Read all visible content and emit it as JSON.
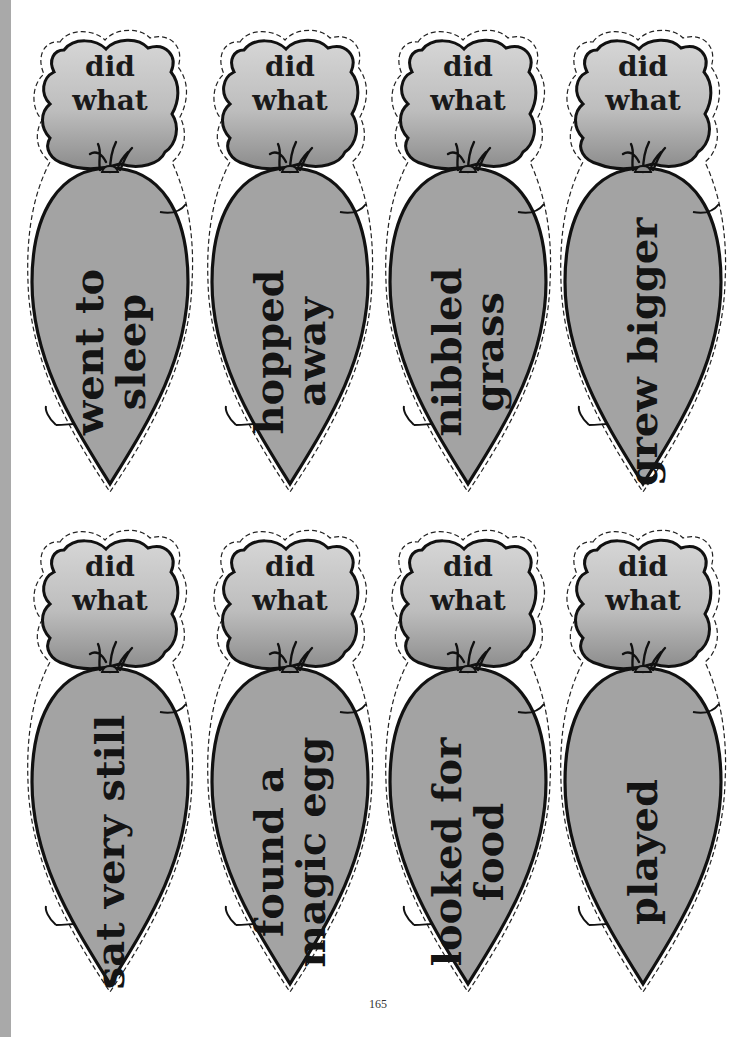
{
  "page": {
    "page_number": "165",
    "colors": {
      "carrot_fill": "#a3a3a3",
      "leaf_top": "#d4d4d4",
      "leaf_bottom": "#8a8a8a",
      "outline": "#111111",
      "edge_strip": "#a9a9a9"
    }
  },
  "cards": [
    {
      "leaf_line1": "did",
      "leaf_line2": "what",
      "body_line1": "went to",
      "body_line2": "sleep"
    },
    {
      "leaf_line1": "did",
      "leaf_line2": "what",
      "body_line1": "hopped",
      "body_line2": "away"
    },
    {
      "leaf_line1": "did",
      "leaf_line2": "what",
      "body_line1": "nibbled",
      "body_line2": "grass"
    },
    {
      "leaf_line1": "did",
      "leaf_line2": "what",
      "body_line1": "grew bigger",
      "body_line2": ""
    },
    {
      "leaf_line1": "did",
      "leaf_line2": "what",
      "body_line1": "sat very still",
      "body_line2": ""
    },
    {
      "leaf_line1": "did",
      "leaf_line2": "what",
      "body_line1": "found a",
      "body_line2": "magic egg"
    },
    {
      "leaf_line1": "did",
      "leaf_line2": "what",
      "body_line1": "looked for",
      "body_line2": "food"
    },
    {
      "leaf_line1": "did",
      "leaf_line2": "what",
      "body_line1": "played",
      "body_line2": ""
    }
  ]
}
